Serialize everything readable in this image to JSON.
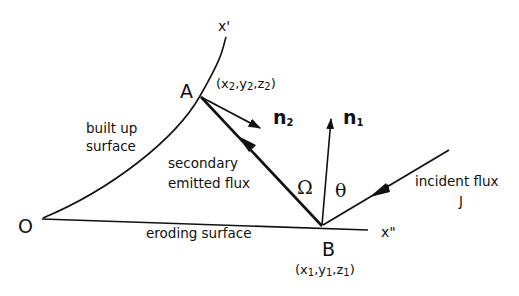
{
  "figure": {
    "background": "#ffffff",
    "ink": "#111111",
    "points": {
      "O": {
        "label": "O",
        "x": 42,
        "y": 219
      },
      "A": {
        "label": "A",
        "x": 200,
        "y": 96,
        "coords": "(x2,y2,z2)"
      },
      "B": {
        "label": "B",
        "x": 322,
        "y": 226,
        "coords": "(x1,y1,z1)"
      }
    },
    "axes": {
      "x_prime": "x'",
      "x_double_prime": "x\""
    },
    "labels": {
      "built_up_surface_line1": "built up",
      "built_up_surface_line2": "surface",
      "eroding_surface": "eroding surface",
      "secondary_flux_line1": "secondary",
      "secondary_flux_line2": "emitted flux",
      "incident_flux": "incident flux",
      "incident_flux_symbol": "J",
      "omega": "Ω",
      "theta": "θ",
      "n1": "n",
      "n1_sub": "1",
      "n2": "n",
      "n2_sub": "2",
      "coord_A": {
        "open": "(x",
        "s1": "2",
        "m1": ",y",
        "s2": "2",
        "m2": ",z",
        "s3": "2",
        "close": ")"
      },
      "coord_B": {
        "open": "(x",
        "s1": "1",
        "m1": ",y",
        "s2": "1",
        "m2": ",z",
        "s3": "1",
        "close": ")"
      }
    }
  }
}
